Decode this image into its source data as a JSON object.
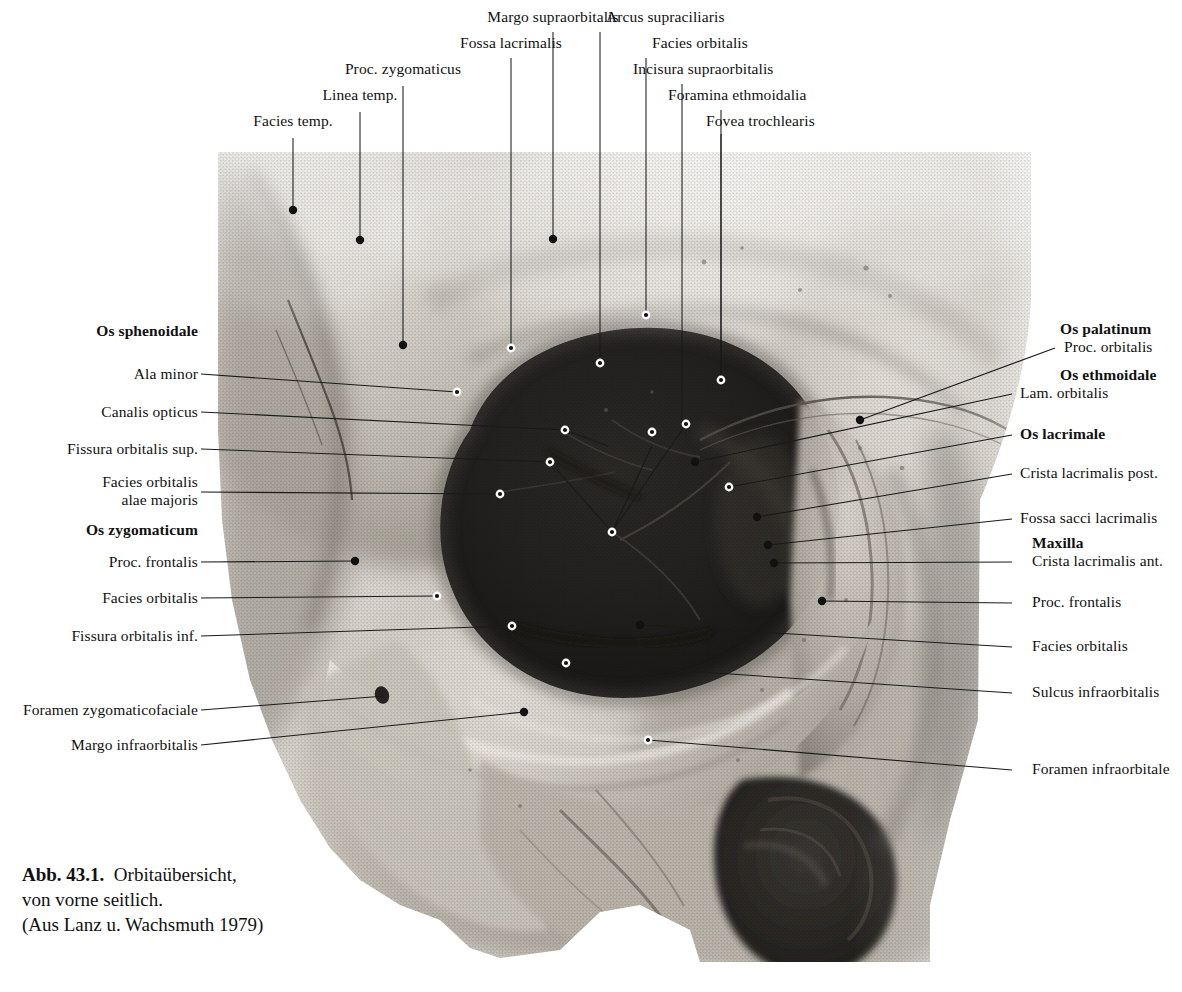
{
  "figure": {
    "caption_number": "Abb. 43.1.",
    "caption_text": "Orbitaübersicht,\nvon vorne seitlich.\n(Aus Lanz u. Wachsmuth 1979)",
    "caption_line1": "Orbitaübersicht,",
    "caption_line2": "von vorne seitlich.",
    "caption_line3": "(Aus Lanz u. Wachsmuth 1979)",
    "colors": {
      "ink": "#111111",
      "leader": "#1a1a1a",
      "paper": "#ffffff",
      "bone_light": "#d8d4cc",
      "bone_mid": "#a9a49a",
      "bone_dark": "#6d6860",
      "orbit_black": "#201e1c"
    }
  },
  "top_labels": [
    {
      "id": "facies-temp",
      "text": "Facies temp."
    },
    {
      "id": "linea-temp",
      "text": "Linea temp."
    },
    {
      "id": "proc-zygomaticus",
      "text": "Proc. zygomaticus"
    },
    {
      "id": "fossa-lacrimalis",
      "text": "Fossa lacrimalis"
    },
    {
      "id": "margo-supraorbitalis",
      "text": "Margo supraorbitalis"
    },
    {
      "id": "arcus-supraciliaris",
      "text": "Arcus supraciliaris"
    },
    {
      "id": "facies-orbitalis-top",
      "text": "Facies orbitalis"
    },
    {
      "id": "incisura-supraorbitalis",
      "text": "Incisura supraorbitalis"
    },
    {
      "id": "foramina-ethmoidalia",
      "text": "Foramina ethmoidalia"
    },
    {
      "id": "fovea-trochlearis",
      "text": "Fovea trochlearis"
    }
  ],
  "left_labels": [
    {
      "id": "os-sphenoidale",
      "text": "Os sphenoidale",
      "bold": true
    },
    {
      "id": "ala-minor",
      "text": "Ala minor",
      "bold": false
    },
    {
      "id": "canalis-opticus",
      "text": "Canalis opticus",
      "bold": false
    },
    {
      "id": "fissura-orbitalis-sup",
      "text": "Fissura orbitalis sup.",
      "bold": false
    },
    {
      "id": "facies-orbitalis-alae-majoris",
      "text": "Facies orbitalis",
      "text2": "alae majoris",
      "bold": false
    },
    {
      "id": "os-zygomaticum",
      "text": "Os zygomaticum",
      "bold": true
    },
    {
      "id": "proc-frontalis-zyg",
      "text": "Proc. frontalis",
      "bold": false
    },
    {
      "id": "facies-orbitalis-zyg",
      "text": "Facies orbitalis",
      "bold": false
    },
    {
      "id": "fissura-orbitalis-inf",
      "text": "Fissura orbitalis inf.",
      "bold": false
    },
    {
      "id": "foramen-zygomaticofaciale",
      "text": "Foramen zygomaticofaciale",
      "bold": false
    },
    {
      "id": "margo-infraorbitalis",
      "text": "Margo infraorbitalis",
      "bold": false
    }
  ],
  "right_labels": [
    {
      "id": "os-palatinum",
      "text": "Os palatinum",
      "bold": true
    },
    {
      "id": "proc-orbitalis",
      "text": "Proc. orbitalis",
      "bold": false
    },
    {
      "id": "os-ethmoidale",
      "text": "Os ethmoidale",
      "bold": true
    },
    {
      "id": "lam-orbitalis",
      "text": "Lam. orbitalis",
      "bold": false
    },
    {
      "id": "os-lacrimale",
      "text": "Os lacrimale",
      "bold": true
    },
    {
      "id": "crista-lacrimalis-post",
      "text": "Crista lacrimalis post.",
      "bold": false
    },
    {
      "id": "fossa-sacci-lacrimalis",
      "text": "Fossa sacci lacrimalis",
      "bold": false
    },
    {
      "id": "maxilla",
      "text": "Maxilla",
      "bold": true
    },
    {
      "id": "crista-lacrimalis-ant",
      "text": "Crista lacrimalis ant.",
      "bold": false
    },
    {
      "id": "proc-frontalis-max",
      "text": "Proc. frontalis",
      "bold": false
    },
    {
      "id": "facies-orbitalis-max",
      "text": "Facies orbitalis",
      "bold": false
    },
    {
      "id": "sulcus-infraorbitalis",
      "text": "Sulcus infraorbitalis",
      "bold": false
    },
    {
      "id": "foramen-infraorbitale",
      "text": "Foramen infraorbitale",
      "bold": false
    }
  ]
}
